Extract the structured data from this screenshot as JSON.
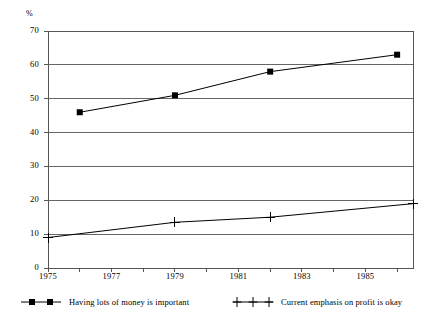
{
  "chart_data": {
    "type": "line",
    "title": "",
    "subtitle": "",
    "xlabel": "",
    "ylabel": "%",
    "unit_label": "%",
    "xlim": [
      1975,
      1986.5
    ],
    "ylim": [
      0,
      70
    ],
    "y_ticks": [
      0,
      10,
      20,
      30,
      40,
      50,
      60,
      70
    ],
    "y_tick_labels": [
      "0",
      "10",
      "20",
      "30",
      "40",
      "50",
      "60",
      "70"
    ],
    "x_ticks": [
      1975,
      1976,
      1977,
      1978,
      1979,
      1980,
      1981,
      1982,
      1983,
      1984,
      1985,
      1986
    ],
    "x_tick_labels": [
      "1975",
      "",
      "1977",
      "",
      "1979",
      "",
      "1981",
      "",
      "1983",
      "",
      "1985",
      ""
    ],
    "x_labeled_ticks": [
      {
        "value": 1975,
        "label": "1975"
      },
      {
        "value": 1977,
        "label": "1977"
      },
      {
        "value": 1979,
        "label": "1979"
      },
      {
        "value": 1981,
        "label": "1981"
      },
      {
        "value": 1983,
        "label": "1983"
      },
      {
        "value": 1985,
        "label": "1985"
      }
    ],
    "grid": "horizontal",
    "legend_position": "bottom",
    "series": [
      {
        "name": "Having lots of money is important",
        "marker": "square",
        "color": "#000000",
        "points": [
          {
            "x": 1976.0,
            "y": 46
          },
          {
            "x": 1979.0,
            "y": 51
          },
          {
            "x": 1982.0,
            "y": 58
          },
          {
            "x": 1986.0,
            "y": 63
          }
        ]
      },
      {
        "name": "Current emphasis on profit is okay",
        "marker": "plus",
        "color": "#000000",
        "points": [
          {
            "x": 1975.0,
            "y": 9
          },
          {
            "x": 1979.0,
            "y": 13.5
          },
          {
            "x": 1982.0,
            "y": 15
          },
          {
            "x": 1986.5,
            "y": 19
          }
        ]
      }
    ]
  },
  "legend": {
    "entries": [
      {
        "label": "Having lots of money is important",
        "marker": "square"
      },
      {
        "label": "Current emphasis on profit is okay",
        "marker": "plus"
      }
    ]
  },
  "colors": {
    "axis": "#555555",
    "grid": "#666666",
    "series": "#000000",
    "background": "#ffffff"
  }
}
